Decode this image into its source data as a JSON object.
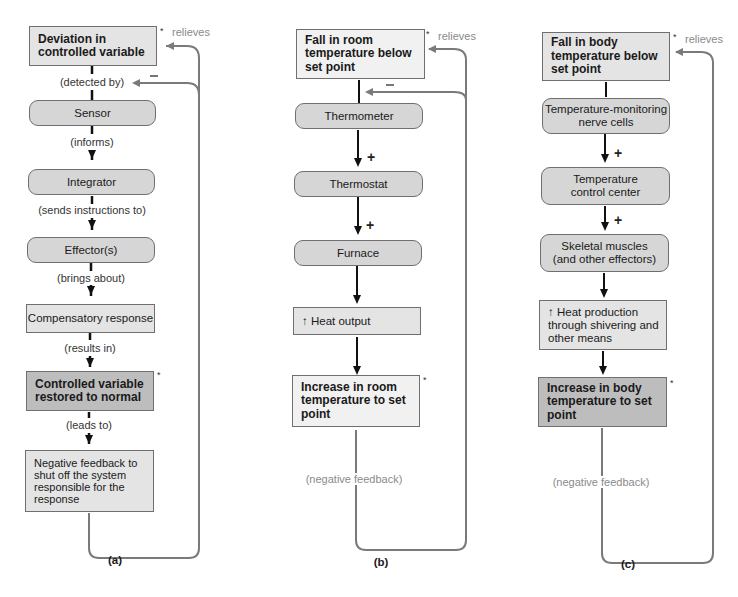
{
  "panel_a": {
    "label": "(a)",
    "boxes": {
      "deviation": "Deviation in\ncontrolled variable",
      "sensor": "Sensor",
      "integrator": "Integrator",
      "effectors": "Effector(s)",
      "compensatory": "Compensatory response",
      "restored": "Controlled variable\nrestored to normal",
      "negative_feedback": "Negative feedback to\nshut off the system\nresponsible for the\nresponse"
    },
    "connectors": {
      "detected_by": "(detected by)",
      "informs": "(informs)",
      "sends_instructions": "(sends instructions to)",
      "brings_about": "(brings about)",
      "results_in": "(results in)",
      "leads_to": "(leads to)"
    },
    "relieves": "relieves",
    "asterisk": "*"
  },
  "panel_b": {
    "label": "(b)",
    "boxes": {
      "fall": "Fall in room\ntemperature below\nset point",
      "thermometer": "Thermometer",
      "thermostat": "Thermostat",
      "furnace": "Furnace",
      "heat_output": "↑ Heat output",
      "increase": "Increase in room\ntemperature to set\npoint"
    },
    "plus": "+",
    "relieves": "relieves",
    "negative_feedback": "(negative feedback)",
    "asterisk": "*"
  },
  "panel_c": {
    "label": "(c)",
    "boxes": {
      "fall": "Fall in body\ntemperature below\nset point",
      "nerve_cells": "Temperature-monitoring\nnerve cells",
      "control_center": "Temperature\ncontrol center",
      "muscles": "Skeletal muscles\n(and other effectors)",
      "heat_production": "↑ Heat production\nthrough shivering and\nother means",
      "increase": "Increase in body\ntemperature to set\npoint"
    },
    "plus": "+",
    "relieves": "relieves",
    "negative_feedback": "(negative feedback)",
    "asterisk": "*"
  },
  "colors": {
    "box_light": "#e4e4e4",
    "box_rounded": "#d6d6d6",
    "box_dark": "#bdbdbd",
    "feedback_line": "#7a7a7a",
    "annotation_text": "#8a8a8a"
  }
}
